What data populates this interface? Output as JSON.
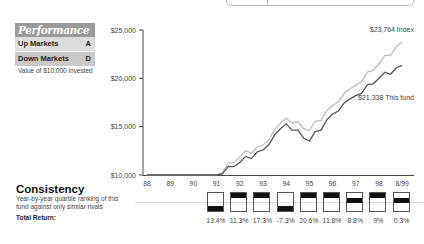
{
  "performance": {
    "header": "Performance in :",
    "rows": [
      {
        "label": "Up Markets",
        "grade": "A"
      },
      {
        "label": "Down Markets",
        "grade": "D"
      }
    ],
    "note": "Value of $10,000 invested"
  },
  "consistency": {
    "title": "Consistency",
    "description_line1": "Year-by-year quartile ranking of this",
    "description_line2": "fund against only similar rivals",
    "total_return_label": "Total Return:"
  },
  "chart_data": {
    "type": "line",
    "title": "Value of $10,000 invested",
    "xlabel": "",
    "ylabel": "",
    "ylim": [
      10000,
      25000
    ],
    "yticks": [
      "$10,000",
      "$15,000",
      "$20,000",
      "$25,000"
    ],
    "categories": [
      "88",
      "89",
      "90",
      "91",
      "92",
      "93",
      "94",
      "95",
      "96",
      "97",
      "98",
      "8/99"
    ],
    "series": [
      {
        "name": "Index",
        "end_label": "$23,764 Index",
        "color": "#bdbdbd",
        "values": [
          10000,
          10000,
          10000,
          10000,
          11900,
          13100,
          15900,
          14600,
          17200,
          19300,
          21500,
          23764
        ]
      },
      {
        "name": "This fund",
        "end_label": "$21,338 This fund",
        "color": "#555555",
        "values": [
          10000,
          10000,
          10000,
          10000,
          11300,
          12600,
          15300,
          13500,
          16300,
          18200,
          20000,
          21338
        ]
      }
    ],
    "quartiles": {
      "years": [
        "91",
        "92",
        "93",
        "94",
        "95",
        "96",
        "97",
        "98",
        "8/99"
      ],
      "rank": [
        4,
        1,
        1,
        4,
        1,
        1,
        2,
        1,
        2
      ],
      "total_return": [
        "13.4%",
        "11.3%",
        "17.3%",
        "-7.3%",
        "20.6%",
        "11.8%",
        "8.8%",
        "9%",
        "0.3%"
      ]
    },
    "grid": false,
    "legend": "end-of-line labels"
  }
}
